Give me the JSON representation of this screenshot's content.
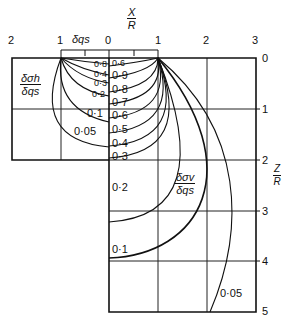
{
  "x_axis": {
    "label_num": "X",
    "label_den": "R",
    "ticks": [
      "2",
      "1",
      "0",
      "1",
      "2",
      "3"
    ],
    "load_label": "δqs"
  },
  "z_axis": {
    "label_num": "Z",
    "label_den": "R",
    "ticks": [
      "0",
      "1",
      "2",
      "3",
      "4",
      "5"
    ]
  },
  "left_panel": {
    "title_num": "δσh",
    "title_den": "δqs",
    "contour_labels": [
      "0·8",
      "0·4",
      "0·3",
      "0·2",
      "0·1",
      "0·05"
    ]
  },
  "right_panel": {
    "title_num": "δσv",
    "title_den": "δqs",
    "contour_labels": [
      "0·6",
      "0·9",
      "0·8",
      "0·7",
      "0·6",
      "0·5",
      "0·4",
      "0·3",
      "0·2",
      "0·1",
      "0·05"
    ]
  }
}
